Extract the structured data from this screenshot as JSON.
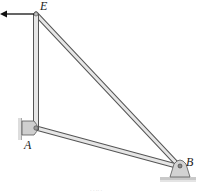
{
  "diagram": {
    "type": "truss-frame",
    "nodes": {
      "E": {
        "label": "E",
        "x": 36,
        "y": 14
      },
      "A": {
        "label": "A",
        "x": 36,
        "y": 128
      },
      "B": {
        "label": "B",
        "x": 180,
        "y": 167
      }
    },
    "members": [
      {
        "from": "E",
        "to": "A"
      },
      {
        "from": "A",
        "to": "B"
      },
      {
        "from": "E",
        "to": "B"
      }
    ],
    "supports": {
      "A": "wall-pin",
      "B": "ground-pin-bracket"
    },
    "load": {
      "at": "E",
      "direction": "left"
    },
    "caption": "· ·  ·· ·"
  },
  "colors": {
    "member_fill": "#e6e6e6",
    "member_stroke": "#555555",
    "support_fill": "#cfcfcf",
    "arrow": "#111111"
  }
}
